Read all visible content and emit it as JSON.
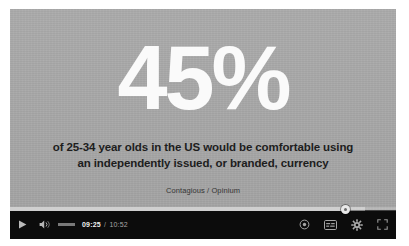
{
  "player": {
    "slide": {
      "headline": "45%",
      "description_lines": [
        "of 25-34 year olds in the US would be comfortable using",
        "an independently issued, or branded, currency"
      ],
      "source": "Contagious / Opinium"
    },
    "controls": {
      "play_icon": "play-icon",
      "volume_icon": "volume-icon",
      "current_time": "09:25",
      "time_separator": "/",
      "duration": "10:52",
      "settings_icon": "gear-icon",
      "captions_icon": "subtitles-icon",
      "quality_icon": "quality-dot-icon",
      "fullscreen_icon": "fullscreen-icon"
    },
    "progress": {
      "played_percent": 87,
      "loaded_percent": 92
    },
    "colors": {
      "video_background": "#a8a8a8",
      "control_bar": "#0c0c0c",
      "headline_text": "#fafafa",
      "body_text": "#1d1d1d",
      "scrubber": "#cfcfcf"
    }
  }
}
